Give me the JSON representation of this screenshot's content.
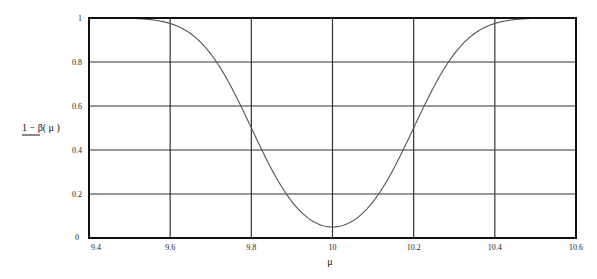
{
  "chart_data": {
    "type": "line",
    "title": "",
    "xlabel": "μ",
    "ylabel": "1 − β( μ )",
    "xlim": [
      9.4,
      10.6
    ],
    "ylim": [
      0,
      1
    ],
    "grid": true,
    "legend": null,
    "x_ticks": [
      "9.4",
      "9.6",
      "9.8",
      "10",
      "10.2",
      "10.4",
      "10.6"
    ],
    "y_ticks": [
      "0",
      "0.2",
      "0.4",
      "0.6",
      "0.8",
      "1"
    ],
    "series": [
      {
        "name": "1 − β(μ)",
        "x": [
          9.4,
          9.45,
          9.5,
          9.55,
          9.6,
          9.65,
          9.7,
          9.75,
          9.8,
          9.85,
          9.9,
          9.95,
          10.0,
          10.05,
          10.1,
          10.15,
          10.2,
          10.25,
          10.3,
          10.35,
          10.4,
          10.45,
          10.5,
          10.55,
          10.6
        ],
        "values": [
          1.0,
          1.0,
          0.998,
          0.993,
          0.975,
          0.929,
          0.836,
          0.688,
          0.5,
          0.312,
          0.165,
          0.078,
          0.05,
          0.078,
          0.165,
          0.312,
          0.5,
          0.688,
          0.836,
          0.929,
          0.975,
          0.993,
          0.998,
          1.0,
          1.0
        ]
      }
    ],
    "colors": {
      "curve": "#555555",
      "grid": "#333333",
      "frame": "#111111"
    }
  }
}
